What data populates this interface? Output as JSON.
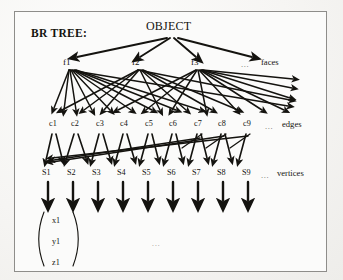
{
  "figure": {
    "title": "BR TREE:",
    "root": {
      "label": "OBJECT"
    },
    "levels": [
      {
        "name": "faces",
        "row_label": "faces",
        "ellipsis": "...",
        "nodes": [
          {
            "label": "f1"
          },
          {
            "label": "f2"
          },
          {
            "label": "f3"
          }
        ]
      },
      {
        "name": "edges",
        "row_label": "edges",
        "ellipsis": "...",
        "nodes": [
          {
            "label": "c1"
          },
          {
            "label": "c2"
          },
          {
            "label": "c3"
          },
          {
            "label": "c4"
          },
          {
            "label": "c5"
          },
          {
            "label": "c6"
          },
          {
            "label": "c7"
          },
          {
            "label": "c8"
          },
          {
            "label": "c9"
          }
        ]
      },
      {
        "name": "vertices",
        "row_label": "vertices",
        "ellipsis": "...",
        "nodes": [
          {
            "label": "S1"
          },
          {
            "label": "S2"
          },
          {
            "label": "S3"
          },
          {
            "label": "S4"
          },
          {
            "label": "S5"
          },
          {
            "label": "S6"
          },
          {
            "label": "S7"
          },
          {
            "label": "S8"
          },
          {
            "label": "S9"
          }
        ]
      }
    ],
    "coordinate_vector": {
      "components": [
        "x1",
        "y1",
        "z1"
      ],
      "ellipsis": "..."
    },
    "colors": {
      "ink": "#14130f",
      "frame": "#8e8d8a",
      "paper": "#fbfbfa",
      "background": "#f3f2f0",
      "faded_ink": "#6d6c68"
    }
  }
}
